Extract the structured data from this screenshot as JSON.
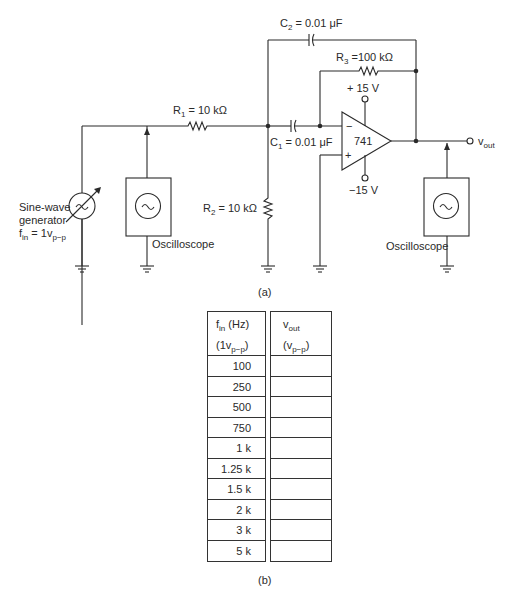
{
  "circuit": {
    "components": {
      "R1": {
        "name": "R",
        "index": "1",
        "value": " = 10 kΩ"
      },
      "R2": {
        "name": "R",
        "index": "2",
        "value": " = 10 kΩ"
      },
      "R3": {
        "name": "R",
        "index": "3",
        "value": " =100 kΩ"
      },
      "C1": {
        "name": "C",
        "index": "1",
        "value": " = 0.01 μF"
      },
      "C2": {
        "name": "C",
        "index": "2",
        "value": " = 0.01 μF"
      },
      "opamp": {
        "label": "741",
        "inverting": "−",
        "noninverting": "+"
      },
      "vplus": "+ 15 V",
      "vminus": "−15 V"
    },
    "generator": {
      "line1": "Sine-wave",
      "line2": "generator",
      "f": "f",
      "f_sub": "in",
      "eq": " = 1v",
      "eq_sub": "p−p"
    },
    "scope1_label": "Oscilloscope",
    "scope2_label": "Oscilloscope",
    "output": {
      "v": "v",
      "sub": "out"
    },
    "caption_a": "(a)"
  },
  "table": {
    "col1_header": {
      "f": "f",
      "f_sub": "in",
      "unit": " (Hz)",
      "line2_pre": "(1v",
      "line2_sub": "p−p",
      "line2_post": ")"
    },
    "col2_header": {
      "v": "v",
      "v_sub": "out",
      "line2_pre": "(v",
      "line2_sub": "p−p",
      "line2_post": ")"
    },
    "rows": [
      "100",
      "250",
      "500",
      "750",
      "1 k",
      "1.25 k",
      "1.5 k",
      "2 k",
      "3 k",
      "5 k"
    ],
    "vout": [
      "",
      "",
      "",
      "",
      "",
      "",
      "",
      "",
      "",
      ""
    ],
    "caption_b": "(b)"
  }
}
